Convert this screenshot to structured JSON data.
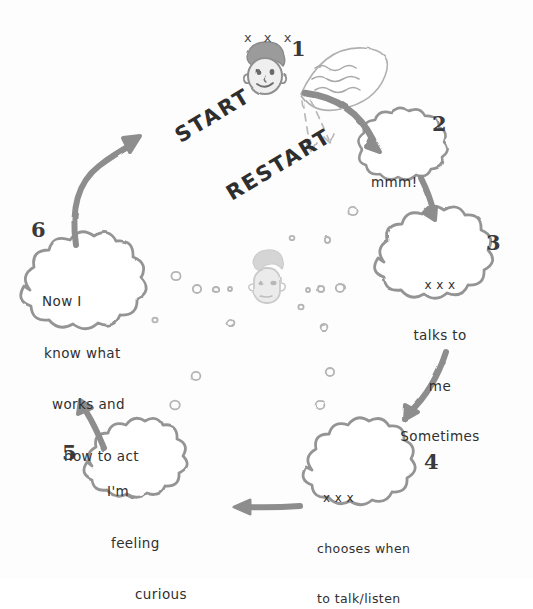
{
  "diagram": {
    "style": "hand-drawn pencil sketch",
    "start_label_line1": "START",
    "start_label_line2": "RESTART",
    "colors": {
      "ink": "#8a8a8a",
      "text": "#2b2b2b",
      "arrow": "#8f8f8f",
      "face_fill": "#d8d8d8",
      "hair": "#9a9a9a"
    },
    "top_head": {
      "name": "person-head-top",
      "marks_above": "x x x"
    },
    "center_head": {
      "name": "person-head-center",
      "faded": "true"
    },
    "speech_leaf": {
      "name": "speech-bubble-squiggles",
      "content": "~~~ ~~~ ~~~"
    },
    "steps": [
      {
        "number": "1",
        "name": "step-1-person-speaks",
        "lines": []
      },
      {
        "number": "2",
        "name": "step-2-mmm",
        "lines": [
          "mmm!"
        ]
      },
      {
        "number": "3",
        "name": "step-3-talks-to-me",
        "lines": [
          "x x x",
          "talks to",
          "me",
          "Sometimes"
        ]
      },
      {
        "number": "4",
        "name": "step-4-chooses-when",
        "lines": [
          "x x x",
          "chooses when",
          "to talk/listen"
        ]
      },
      {
        "number": "5",
        "name": "step-5-feeling-curious",
        "lines": [
          "I'm",
          "feeling",
          "curious"
        ]
      },
      {
        "number": "6",
        "name": "step-6-now-i-know",
        "lines": [
          "Now I",
          "know what",
          "works and",
          "how to act"
        ]
      }
    ]
  }
}
